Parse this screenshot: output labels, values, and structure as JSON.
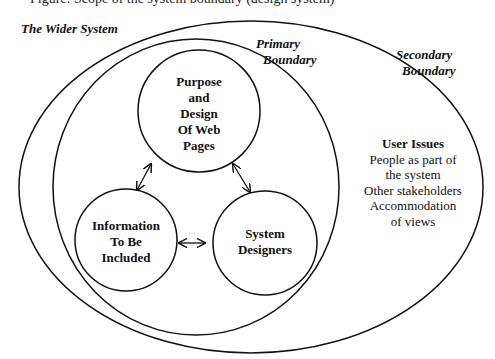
{
  "caption": {
    "text_cut_off": "Figure: Scope of the system boundary (design system)"
  },
  "labels": {
    "wider_system": "The Wider System",
    "primary_boundary": [
      "Primary",
      "Boundary"
    ],
    "secondary_boundary": [
      "Secondary",
      "Boundary"
    ]
  },
  "nodes": {
    "purpose": [
      "Purpose",
      "and",
      "Design",
      "Of Web",
      "Pages"
    ],
    "information": [
      "Information",
      "To Be",
      "Included"
    ],
    "designers": [
      "System",
      "Designers"
    ]
  },
  "user_issues": {
    "title": "User Issues",
    "lines": [
      "People as part of",
      "the system",
      "Other stakeholders",
      "Accommodation",
      "of views"
    ]
  },
  "edges": [
    {
      "from": "purpose",
      "to": "information",
      "type": "bidirectional"
    },
    {
      "from": "purpose",
      "to": "designers",
      "type": "bidirectional"
    },
    {
      "from": "information",
      "to": "designers",
      "type": "bidirectional"
    }
  ],
  "colors": {
    "stroke": "#111111",
    "background": "#ffffff"
  }
}
